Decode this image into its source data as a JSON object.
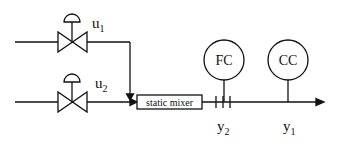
{
  "diagram": {
    "type": "process-control-schematic",
    "inputs": [
      {
        "id": "u1",
        "label": "u",
        "subscript": "1",
        "element": "control-valve"
      },
      {
        "id": "u2",
        "label": "u",
        "subscript": "2",
        "element": "control-valve"
      }
    ],
    "mixer": {
      "label": "static mixer"
    },
    "controllers": [
      {
        "id": "fc",
        "label": "FC"
      },
      {
        "id": "cc",
        "label": "CC"
      }
    ],
    "outputs": [
      {
        "id": "y2",
        "label": "y",
        "subscript": "2",
        "measured_by": "FC"
      },
      {
        "id": "y1",
        "label": "y",
        "subscript": "1",
        "measured_by": "CC"
      }
    ],
    "colors": {
      "stroke": "#111111",
      "background": "#ffffff"
    }
  }
}
